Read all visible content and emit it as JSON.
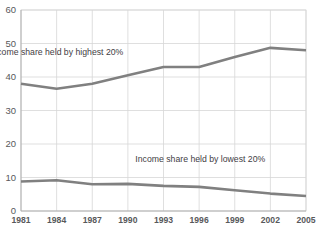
{
  "chart_data": {
    "type": "line",
    "title": "",
    "xlabel": "",
    "ylabel": "",
    "x": [
      1981,
      1984,
      1987,
      1990,
      1993,
      1996,
      1999,
      2002,
      2005
    ],
    "xtick_labels": [
      "1981",
      "1984",
      "1987",
      "1990",
      "1993",
      "1996",
      "1999",
      "2002",
      "2005"
    ],
    "ytick_labels": [
      "0",
      "10",
      "20",
      "30",
      "40",
      "50",
      "60"
    ],
    "yticks": [
      0,
      10,
      20,
      30,
      40,
      50,
      60
    ],
    "ylim": [
      0,
      60
    ],
    "xlim": [
      1981,
      2005
    ],
    "grid": true,
    "legend_position": "inline-annotation",
    "series": [
      {
        "name": "Income share held by highest 20%",
        "color": "#808080",
        "values": [
          38.0,
          36.5,
          38.0,
          40.5,
          43.0,
          43.0,
          46.0,
          48.7,
          48.0
        ]
      },
      {
        "name": "Income share held by lowest 20%",
        "color": "#808080",
        "values": [
          8.8,
          9.2,
          8.0,
          8.1,
          7.5,
          7.2,
          6.2,
          5.2,
          4.5
        ]
      }
    ],
    "annotations": [
      {
        "text": "Income share held by highest 20%",
        "x": 1984.0,
        "y": 46.5
      },
      {
        "text": "Income share held by lowest 20%",
        "x": 1996.1,
        "y": 14.6
      }
    ]
  }
}
